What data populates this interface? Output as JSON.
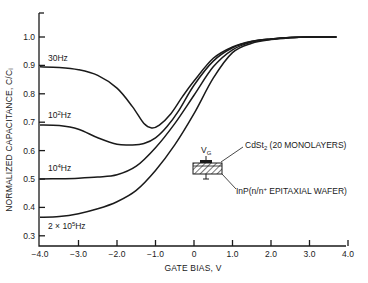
{
  "chart_data": {
    "type": "line",
    "title": "",
    "xlabel": "GATE BIAS, V",
    "ylabel": "NORMALIZED CAPACITANCE, C/Cᵢ",
    "xlim": [
      -4.0,
      4.0
    ],
    "ylim": [
      0.3,
      1.08
    ],
    "x_ticks": [
      -4.0,
      -3.0,
      -2.0,
      -1.0,
      0,
      1.0,
      2.0,
      3.0,
      4.0
    ],
    "x_tick_labels": [
      "−4.0",
      "−3.0",
      "−2.0",
      "−1.0",
      "0",
      "1.0",
      "2.0",
      "3.0",
      "4.0"
    ],
    "y_ticks": [
      0.3,
      0.4,
      0.5,
      0.6,
      0.7,
      0.8,
      0.9,
      1.0
    ],
    "y_tick_labels": [
      "0.3",
      "0.4",
      "0.5",
      "0.6",
      "0.7",
      "0.8",
      "0.9",
      "1.0"
    ],
    "grid": false,
    "legend": "inline curve labels",
    "series": [
      {
        "name": "30Hz",
        "label_main": "30Hz",
        "label_sup": "",
        "x": [
          -4.0,
          -3.5,
          -3.0,
          -2.5,
          -2.0,
          -1.6,
          -1.3,
          -1.1,
          -0.9,
          -0.6,
          -0.3,
          0.0,
          0.5,
          1.0,
          1.5,
          2.0,
          2.5,
          3.0,
          3.7
        ],
        "y": [
          0.895,
          0.893,
          0.885,
          0.865,
          0.82,
          0.755,
          0.695,
          0.68,
          0.69,
          0.73,
          0.79,
          0.845,
          0.925,
          0.965,
          0.985,
          0.993,
          0.998,
          1.0,
          1.0
        ]
      },
      {
        "name": "10^2Hz",
        "label_main": "10",
        "label_sup": "2",
        "label_tail": "Hz",
        "x": [
          -4.0,
          -3.5,
          -3.0,
          -2.5,
          -2.0,
          -1.6,
          -1.3,
          -1.0,
          -0.7,
          -0.4,
          0.0,
          0.5,
          1.0,
          1.5,
          2.0,
          2.5,
          3.0,
          3.7
        ],
        "y": [
          0.69,
          0.688,
          0.675,
          0.645,
          0.622,
          0.62,
          0.625,
          0.645,
          0.685,
          0.74,
          0.83,
          0.915,
          0.962,
          0.984,
          0.993,
          0.998,
          1.0,
          1.0
        ]
      },
      {
        "name": "10^4Hz",
        "label_main": "10",
        "label_sup": "4",
        "label_tail": "Hz",
        "x": [
          -4.0,
          -3.5,
          -3.0,
          -2.5,
          -2.0,
          -1.5,
          -1.0,
          -0.5,
          0.0,
          0.5,
          1.0,
          1.5,
          2.0,
          2.5,
          3.0,
          3.7
        ],
        "y": [
          0.5,
          0.501,
          0.503,
          0.507,
          0.515,
          0.545,
          0.61,
          0.695,
          0.795,
          0.895,
          0.955,
          0.982,
          0.992,
          0.998,
          1.0,
          1.0
        ]
      },
      {
        "name": "2 × 10^5Hz",
        "label_main": "2 × 10",
        "label_sup": "5",
        "label_tail": "Hz",
        "x": [
          -4.0,
          -3.5,
          -3.0,
          -2.5,
          -2.0,
          -1.5,
          -1.0,
          -0.5,
          0.0,
          0.5,
          1.0,
          1.5,
          2.0,
          2.5,
          3.0,
          3.7
        ],
        "y": [
          0.365,
          0.368,
          0.378,
          0.395,
          0.42,
          0.46,
          0.53,
          0.62,
          0.73,
          0.855,
          0.945,
          0.978,
          0.991,
          0.997,
          1.0,
          1.0
        ]
      }
    ],
    "annotations": {
      "inset_gate_label": "V",
      "inset_gate_sub": "G",
      "cdst_label_main": "CdSt",
      "cdst_label_sub": "2",
      "cdst_label_tail": " (20 MONOLAYERS)",
      "inp_label_main": "InP(n/n",
      "inp_label_sup": "+",
      "inp_label_tail": " EPITAXIAL WAFER)"
    }
  }
}
